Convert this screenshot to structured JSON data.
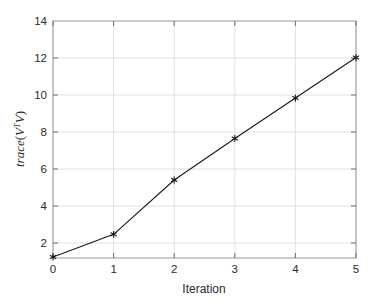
{
  "chart_data": {
    "type": "line",
    "title": "",
    "xlabel": "Iteration",
    "ylabel": "trace(V^T V)",
    "ylabel_parts": {
      "func": "trace",
      "open": "(",
      "var1": "V",
      "sup": "T",
      "var2": "V",
      "close": ")"
    },
    "x": [
      0,
      1,
      2,
      3,
      4,
      5
    ],
    "values": [
      2.05,
      3.2,
      5.95,
      8.05,
      10.1,
      12.15
    ],
    "xlim": [
      0,
      5
    ],
    "ylim": [
      2,
      14
    ],
    "xticks": [
      "0",
      "1",
      "2",
      "3",
      "4",
      "5"
    ],
    "yticks": [
      "2",
      "4",
      "6",
      "8",
      "10",
      "12",
      "14"
    ],
    "xtick_values": [
      0,
      1,
      2,
      3,
      4,
      5
    ],
    "ytick_values": [
      2,
      4,
      6,
      8,
      10,
      12,
      14
    ],
    "grid": true,
    "legend": null,
    "marker": "asterisk",
    "line_color": "#1a1a1a",
    "marker_color": "#1a1a1a",
    "grid_color": "#d9d9d9",
    "axis_color": "#9a9a9a",
    "background": "#ffffff",
    "linewidth": 1.1
  }
}
